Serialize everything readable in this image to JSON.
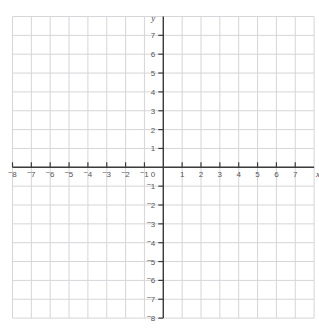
{
  "top_clipped_text": "",
  "colors": {
    "grid_line": "#d6d6da",
    "axis_line": "#3c3c3c",
    "tick_label": "#555555",
    "axis_letter": "#4a4a4a",
    "background": "#ffffff"
  },
  "chart_data": {
    "type": "scatter",
    "title": "",
    "xlabel": "x",
    "ylabel": "y",
    "grid": true,
    "legend": null,
    "xlim": [
      -8,
      8
    ],
    "ylim": [
      -8,
      8
    ],
    "x_tick_step": 1,
    "y_tick_step": 1,
    "x_tick_labels": [
      "⁻8",
      "⁻7",
      "⁻6",
      "⁻5",
      "⁻4",
      "⁻3",
      "⁻2",
      "⁻1",
      "0",
      "1",
      "2",
      "3",
      "4",
      "5",
      "6",
      "7"
    ],
    "y_tick_labels": [
      "7",
      "6",
      "5",
      "4",
      "3",
      "2",
      "1",
      "0",
      "⁻1",
      "⁻2",
      "⁻3",
      "⁻4",
      "⁻5",
      "⁻6",
      "⁻7",
      "⁻8"
    ],
    "series": [],
    "values": [],
    "categories": []
  },
  "axes": {
    "x_label": "x",
    "y_label": "y",
    "origin_label": "0"
  },
  "x_ticks": [
    {
      "value": -8,
      "neg": true,
      "digit": "8"
    },
    {
      "value": -7,
      "neg": true,
      "digit": "7"
    },
    {
      "value": -6,
      "neg": true,
      "digit": "6"
    },
    {
      "value": -5,
      "neg": true,
      "digit": "5"
    },
    {
      "value": -4,
      "neg": true,
      "digit": "4"
    },
    {
      "value": -3,
      "neg": true,
      "digit": "3"
    },
    {
      "value": -2,
      "neg": true,
      "digit": "2"
    },
    {
      "value": -1,
      "neg": true,
      "digit": "1"
    },
    {
      "value": 1,
      "neg": false,
      "digit": "1"
    },
    {
      "value": 2,
      "neg": false,
      "digit": "2"
    },
    {
      "value": 3,
      "neg": false,
      "digit": "3"
    },
    {
      "value": 4,
      "neg": false,
      "digit": "4"
    },
    {
      "value": 5,
      "neg": false,
      "digit": "5"
    },
    {
      "value": 6,
      "neg": false,
      "digit": "6"
    },
    {
      "value": 7,
      "neg": false,
      "digit": "7"
    }
  ],
  "y_ticks": [
    {
      "value": 7,
      "neg": false,
      "digit": "7"
    },
    {
      "value": 6,
      "neg": false,
      "digit": "6"
    },
    {
      "value": 5,
      "neg": false,
      "digit": "5"
    },
    {
      "value": 4,
      "neg": false,
      "digit": "4"
    },
    {
      "value": 3,
      "neg": false,
      "digit": "3"
    },
    {
      "value": 2,
      "neg": false,
      "digit": "2"
    },
    {
      "value": 1,
      "neg": false,
      "digit": "1"
    },
    {
      "value": -1,
      "neg": true,
      "digit": "1"
    },
    {
      "value": -2,
      "neg": true,
      "digit": "2"
    },
    {
      "value": -3,
      "neg": true,
      "digit": "3"
    },
    {
      "value": -4,
      "neg": true,
      "digit": "4"
    },
    {
      "value": -5,
      "neg": true,
      "digit": "5"
    },
    {
      "value": -6,
      "neg": true,
      "digit": "6"
    },
    {
      "value": -7,
      "neg": true,
      "digit": "7"
    },
    {
      "value": -8,
      "neg": true,
      "digit": "8"
    }
  ]
}
